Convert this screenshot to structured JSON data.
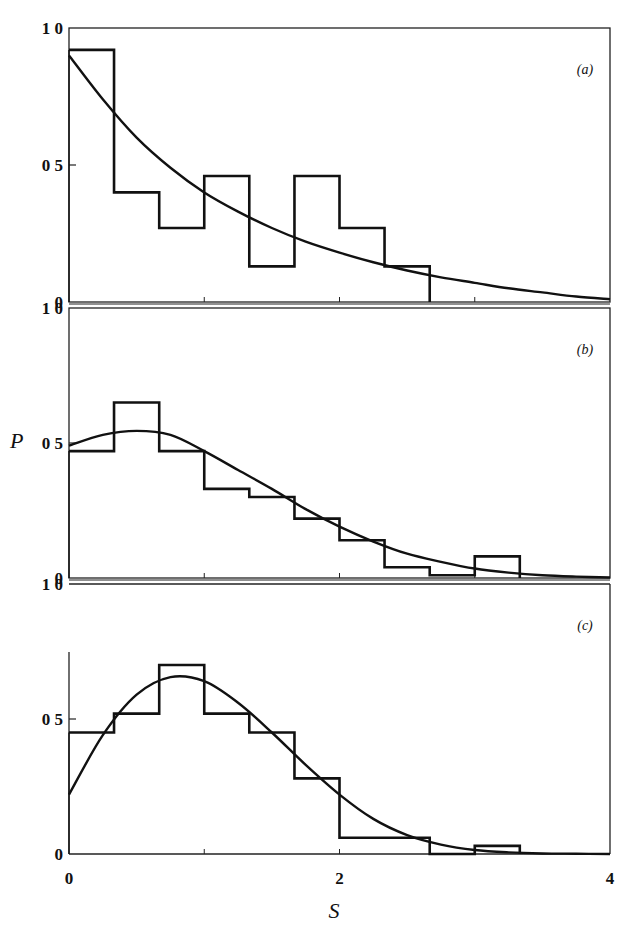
{
  "figure": {
    "xlabel": "S",
    "ylabel": "P",
    "x_ticks": [
      {
        "value": 0,
        "label": "0"
      },
      {
        "value": 2,
        "label": "2"
      },
      {
        "value": 4,
        "label": "4"
      }
    ]
  },
  "chart_data": [
    {
      "type": "bar",
      "panel": "(a)",
      "title": "(a)",
      "xlabel": "S",
      "ylabel": "P",
      "xlim": [
        0,
        4
      ],
      "ylim": [
        0,
        1.0
      ],
      "y_tick_labels": [
        "0",
        "0.5",
        "1.0"
      ],
      "grid": false,
      "bin_width": 0.3333,
      "histogram": {
        "bin_edges": [
          0,
          0.333,
          0.667,
          1.0,
          1.333,
          1.667,
          2.0,
          2.333,
          2.667
        ],
        "values": [
          0.92,
          0.4,
          0.27,
          0.46,
          0.13,
          0.46,
          0.27,
          0.13
        ]
      },
      "curve": {
        "name": "fit (exponential)",
        "x": [
          0,
          0.25,
          0.5,
          0.75,
          1.0,
          1.25,
          1.5,
          1.75,
          2.0,
          2.25,
          2.5,
          2.75,
          3.0,
          3.25,
          3.5,
          3.75,
          4.0
        ],
        "y": [
          0.9,
          0.74,
          0.6,
          0.49,
          0.4,
          0.33,
          0.27,
          0.22,
          0.18,
          0.145,
          0.115,
          0.09,
          0.07,
          0.05,
          0.035,
          0.02,
          0.01
        ]
      }
    },
    {
      "type": "bar",
      "panel": "(b)",
      "title": "(b)",
      "xlabel": "S",
      "ylabel": "P",
      "xlim": [
        0,
        4
      ],
      "ylim": [
        0,
        1.0
      ],
      "y_tick_labels": [
        "0",
        "0.5",
        "1.0"
      ],
      "grid": false,
      "bin_width": 0.3333,
      "histogram": {
        "bin_edges": [
          0,
          0.333,
          0.667,
          1.0,
          1.333,
          1.667,
          2.0,
          2.333,
          2.667,
          3.0,
          3.333
        ],
        "values": [
          0.47,
          0.65,
          0.47,
          0.33,
          0.3,
          0.22,
          0.14,
          0.04,
          0.01,
          0.08
        ]
      },
      "curve": {
        "name": "fit",
        "x": [
          0,
          0.25,
          0.5,
          0.75,
          1.0,
          1.25,
          1.5,
          1.75,
          2.0,
          2.25,
          2.5,
          2.75,
          3.0,
          3.25,
          3.5,
          3.75,
          4.0
        ],
        "y": [
          0.49,
          0.53,
          0.545,
          0.53,
          0.47,
          0.4,
          0.33,
          0.255,
          0.19,
          0.135,
          0.09,
          0.06,
          0.035,
          0.02,
          0.01,
          0.005,
          0.002
        ]
      }
    },
    {
      "type": "bar",
      "panel": "(c)",
      "title": "(c)",
      "xlabel": "S",
      "ylabel": "P",
      "xlim": [
        0,
        4
      ],
      "ylim": [
        0,
        1.0
      ],
      "y_tick_labels": [
        "0",
        "0.5",
        "1.0"
      ],
      "grid": false,
      "bin_width": 0.3333,
      "histogram": {
        "bin_edges": [
          0,
          0.333,
          0.667,
          1.0,
          1.333,
          1.667,
          2.0,
          2.333,
          2.667,
          3.0,
          3.333
        ],
        "values": [
          0.45,
          0.52,
          0.7,
          0.52,
          0.45,
          0.28,
          0.06,
          0.06,
          0.0,
          0.03
        ]
      },
      "curve": {
        "name": "fit",
        "x": [
          0,
          0.25,
          0.5,
          0.75,
          1.0,
          1.25,
          1.5,
          1.75,
          2.0,
          2.25,
          2.5,
          2.75,
          3.0,
          3.25,
          3.5,
          3.75,
          4.0
        ],
        "y": [
          0.22,
          0.44,
          0.59,
          0.655,
          0.64,
          0.56,
          0.45,
          0.33,
          0.22,
          0.13,
          0.07,
          0.035,
          0.015,
          0.006,
          0.002,
          0.001,
          0.0
        ]
      }
    }
  ]
}
